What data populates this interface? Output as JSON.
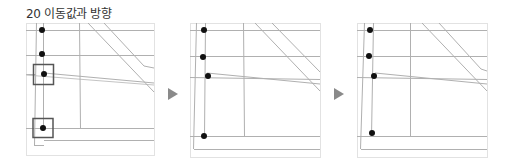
{
  "figure": {
    "title": "20 이동값과 방향",
    "colors": {
      "line": "#b5b5b5",
      "dark_line": "#8f8f8f",
      "frame": "#dddddd",
      "dot": "#111111",
      "selection_box": "#555555",
      "arrow": "#8a8a8a"
    },
    "steps": [
      {
        "label": "step-1",
        "points": 4,
        "selected_points": 2
      },
      {
        "label": "step-2",
        "points": 4,
        "selected_points": 0
      },
      {
        "label": "step-3",
        "points": 4,
        "selected_points": 0
      }
    ],
    "arrows": [
      "next-step-arrow",
      "next-step-arrow"
    ]
  }
}
